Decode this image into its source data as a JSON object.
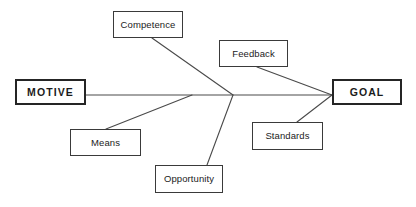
{
  "diagram": {
    "type": "fishbone-cause-and-effect",
    "width": 416,
    "height": 207,
    "background_color": "#ffffff",
    "line_color": "#4a4a4a",
    "box_border_color": "#3a3a3a",
    "terminal_border_color": "#252525",
    "text_color": "#1b1b1b",
    "spine": {
      "start_x": 86,
      "end_x": 332,
      "y": 95,
      "junction_x": 233,
      "junction_y": 95
    },
    "nodes": [
      {
        "id": "motive",
        "label": "MOTIVE",
        "role": "terminal-start",
        "emphasis": "bold",
        "x": 15,
        "y": 79,
        "w": 71,
        "h": 26
      },
      {
        "id": "goal",
        "label": "GOAL",
        "role": "terminal-end",
        "emphasis": "bold",
        "x": 332,
        "y": 79,
        "w": 70,
        "h": 26
      },
      {
        "id": "competence",
        "label": "Competence",
        "role": "factor",
        "emphasis": "regular",
        "x": 113,
        "y": 11,
        "w": 70,
        "h": 27
      },
      {
        "id": "feedback",
        "label": "Feedback",
        "role": "factor",
        "emphasis": "regular",
        "x": 219,
        "y": 40,
        "w": 69,
        "h": 27
      },
      {
        "id": "means",
        "label": "Means",
        "role": "factor",
        "emphasis": "regular",
        "x": 70,
        "y": 129,
        "w": 71,
        "h": 27
      },
      {
        "id": "opportunity",
        "label": "Opportunity",
        "role": "factor",
        "emphasis": "regular",
        "x": 155,
        "y": 165,
        "w": 68,
        "h": 28
      },
      {
        "id": "standards",
        "label": "Standards",
        "role": "factor",
        "emphasis": "regular",
        "x": 252,
        "y": 122,
        "w": 71,
        "h": 28
      }
    ],
    "connectors": [
      {
        "id": "spine-line",
        "from": "motive",
        "to": "goal",
        "x1": 86,
        "y1": 95,
        "x2": 332,
        "y2": 95
      },
      {
        "id": "competence-to-spine",
        "from": "competence",
        "to": "junction",
        "x1": 152,
        "y1": 38,
        "x2": 233,
        "y2": 95
      },
      {
        "id": "means-to-spine",
        "from": "means",
        "to": "spine",
        "x1": 106,
        "y1": 129,
        "x2": 192,
        "y2": 95
      },
      {
        "id": "opportunity-to-spine",
        "from": "opportunity",
        "to": "junction",
        "x1": 207,
        "y1": 165,
        "x2": 233,
        "y2": 95
      },
      {
        "id": "feedback-to-goal",
        "from": "feedback",
        "to": "goal",
        "x1": 257,
        "y1": 67,
        "x2": 332,
        "y2": 95
      },
      {
        "id": "standards-to-goal",
        "from": "standards",
        "to": "goal",
        "x1": 297,
        "y1": 122,
        "x2": 332,
        "y2": 95
      }
    ]
  }
}
